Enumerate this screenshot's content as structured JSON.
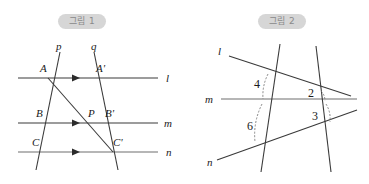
{
  "figures": [
    {
      "badge": "그림 1",
      "description": "three parallel lines cut by two transversals",
      "line_labels": [
        "l",
        "m",
        "n"
      ],
      "transversal_labels": [
        "p",
        "q"
      ],
      "point_labels": [
        "A",
        "A'",
        "B",
        "P",
        "B'",
        "C",
        "C'"
      ],
      "parallel_marks": 3
    },
    {
      "badge": "그림 2",
      "description": "three lines cut by two transversals with numbered angles",
      "line_labels": [
        "l",
        "m",
        "n"
      ],
      "angle_labels": [
        "4",
        "2",
        "6",
        "3"
      ]
    }
  ],
  "colors": {
    "line": "#3a3a3a",
    "line_soft": "#6f6f6f",
    "badge_bg": "#d6d6d6",
    "badge_text": "#8a8a8a",
    "label": "#1a1a1a",
    "arc": "#7a7a7a"
  }
}
